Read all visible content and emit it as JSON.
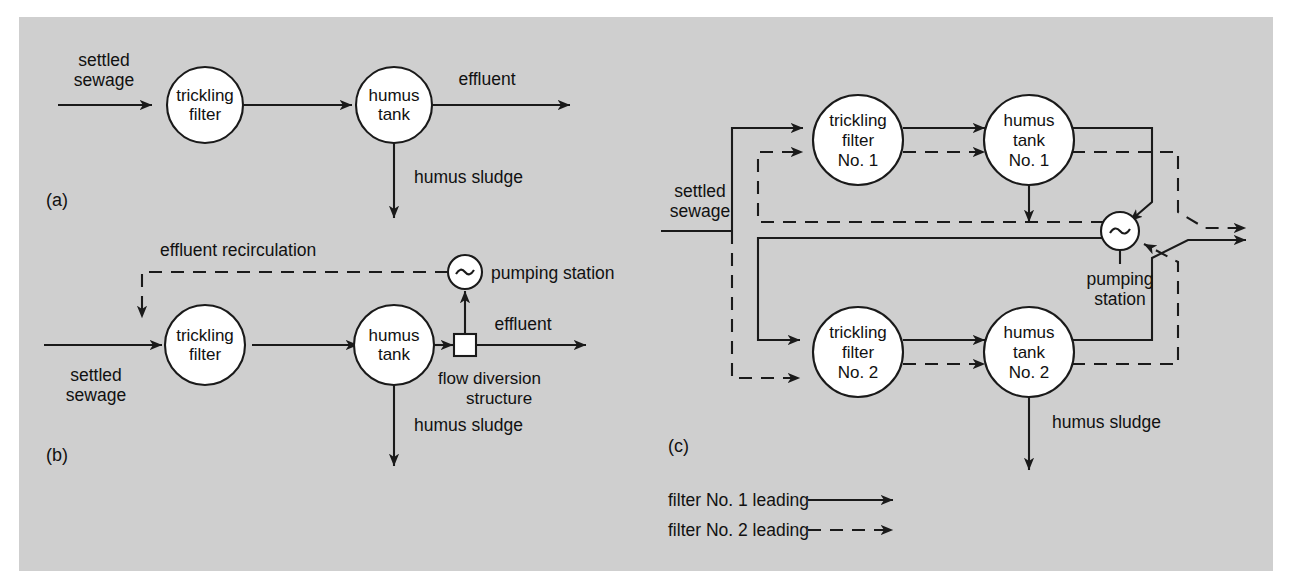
{
  "figure": {
    "background_color": "#cfcfcf",
    "page_color": "#ffffff",
    "line_color": "#1a1a1a",
    "node_fill": "#ffffff",
    "caption_a": "(a)",
    "caption_b": "(b)",
    "caption_c": "(c)"
  },
  "panel_a": {
    "id": "(a)",
    "inlet_label_line1": "settled",
    "inlet_label_line2": "sewage",
    "node_filter_line1": "trickling",
    "node_filter_line2": "filter",
    "node_tank_line1": "humus",
    "node_tank_line2": "tank",
    "effluent_label": "effluent",
    "sludge_label": "humus sludge"
  },
  "panel_b": {
    "id": "(b)",
    "recirculation_label": "effluent recirculation",
    "pumping_station_label": "pumping station",
    "inlet_label_line1": "settled",
    "inlet_label_line2": "sewage",
    "node_filter_line1": "trickling",
    "node_filter_line2": "filter",
    "node_tank_line1": "humus",
    "node_tank_line2": "tank",
    "effluent_label": "effluent",
    "diversion_label_line1": "flow diversion",
    "diversion_label_line2": "structure",
    "sludge_label": "humus sludge",
    "pump_symbol": "~"
  },
  "panel_c": {
    "id": "(c)",
    "inlet_label_line1": "settled",
    "inlet_label_line2": "sewage",
    "filter1_line1": "trickling",
    "filter1_line2": "filter",
    "filter1_line3": "No. 1",
    "tank1_line1": "humus",
    "tank1_line2": "tank",
    "tank1_line3": "No. 1",
    "filter2_line1": "trickling",
    "filter2_line2": "filter",
    "filter2_line3": "No. 2",
    "tank2_line1": "humus",
    "tank2_line2": "tank",
    "tank2_line3": "No. 2",
    "pumping_station_line1": "pumping",
    "pumping_station_line2": "station",
    "pump_symbol": "~",
    "sludge_label": "humus sludge"
  },
  "legend": {
    "items": [
      {
        "label": "filter No. 1 leading",
        "style": "solid"
      },
      {
        "label": "filter No. 2 leading",
        "style": "dashed"
      }
    ]
  }
}
